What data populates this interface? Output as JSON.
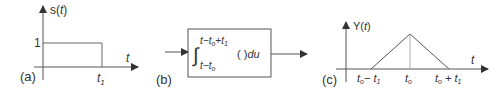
{
  "panel_a": {
    "label": "(a)",
    "y_axis_label_fn": "s(",
    "y_axis_label_var": "t",
    "y_axis_label_close": ")",
    "level_label": "1",
    "x_axis_label": "t",
    "tick_label_base": "t",
    "tick_label_sub": "1"
  },
  "panel_b": {
    "label": "(b)",
    "upper_limit": {
      "t": "t",
      "minus": "−",
      "t0": "t",
      "t0_sub": "o",
      "plus": "+",
      "t1": "t",
      "t1_sub": "1"
    },
    "lower_limit": {
      "t": "t",
      "minus": "−",
      "t0": "t",
      "t0_sub": "o"
    },
    "integrand": "(  )",
    "differential": "du"
  },
  "panel_c": {
    "label": "(c)",
    "y_axis_label_fn": "Y(",
    "y_axis_label_var": "t",
    "y_axis_label_close": ")",
    "x_axis_label": "t",
    "tick_left": {
      "t": "t",
      "sub": "o",
      "op": "− ",
      "t1": "t",
      "t1_sub": "1"
    },
    "tick_mid": {
      "t": "t",
      "sub": "o"
    },
    "tick_right": {
      "t": "t",
      "sub": "o",
      "op": " + ",
      "t1": "t",
      "t1_sub": "1"
    }
  },
  "colors": {
    "stroke": "#555555",
    "text": "#333333"
  }
}
